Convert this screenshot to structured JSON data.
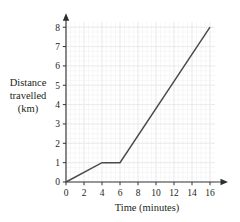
{
  "chart_data": {
    "type": "line",
    "title": "",
    "subtitle": "",
    "xlabel": "Time (minutes)",
    "ylabel": "Distance travelled (km)",
    "ylabel_lines": [
      "Distance",
      "travelled",
      "(km)"
    ],
    "xlim": [
      0,
      16
    ],
    "ylim": [
      0,
      8
    ],
    "xticks": [
      0,
      2,
      4,
      6,
      8,
      10,
      12,
      14,
      16
    ],
    "yticks": [
      0,
      1,
      2,
      3,
      4,
      5,
      6,
      7,
      8
    ],
    "xtick_labels": [
      "0",
      "2",
      "4",
      "6",
      "8",
      "10",
      "12",
      "14",
      "16"
    ],
    "ytick_labels": [
      "0",
      "1",
      "2",
      "3",
      "4",
      "5",
      "6",
      "7",
      "8"
    ],
    "x_minor_step": 0.5,
    "y_minor_step": 0.25,
    "grid": true,
    "grid_color": "#f0f0f2",
    "grid_major_color": "#e6e6ea",
    "legend": false,
    "legend_position": "none",
    "axis_color": "#3a3a3c",
    "line_color": "#4a4a4c",
    "axis_arrows": true,
    "series": [
      {
        "name": "Distance travelled",
        "x": [
          0,
          4,
          6,
          16
        ],
        "y": [
          0,
          1,
          1,
          8
        ],
        "segments": [
          {
            "from": [
              0,
              0
            ],
            "to": [
              4,
              1
            ],
            "description": "steady travel, 0.25 km per minute"
          },
          {
            "from": [
              4,
              1
            ],
            "to": [
              6,
              1
            ],
            "description": "stationary, no distance gained"
          },
          {
            "from": [
              6,
              1
            ],
            "to": [
              16,
              8
            ],
            "description": "faster travel, 0.7 km per minute"
          }
        ]
      }
    ]
  },
  "axes": {
    "x_title": "Time (minutes)",
    "y_title_line1": "Distance",
    "y_title_line2": "travelled",
    "y_title_line3": "(km)"
  }
}
